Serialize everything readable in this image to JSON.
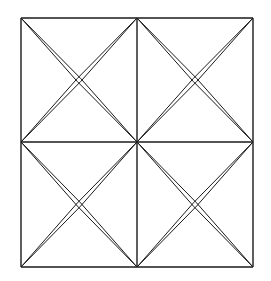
{
  "diagram": {
    "stroke_color": "#1a1a1a",
    "background": "#ffffff",
    "grid": {
      "xs": [
        21,
        137,
        253
      ],
      "ys": [
        18,
        142,
        267
      ]
    },
    "double_line_offset": 1.6
  }
}
